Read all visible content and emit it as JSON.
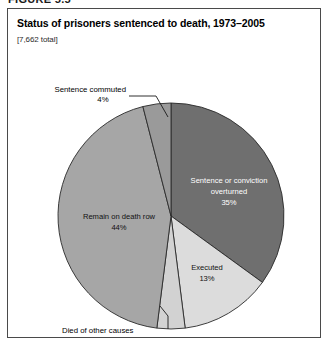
{
  "figure": {
    "number_label": "FIGURE 5.5"
  },
  "panel": {
    "title": "Status of prisoners sentenced to death, 1973–2005",
    "subtitle": "[7,662 total]"
  },
  "colors": {
    "overturned": "#6f6f6f",
    "executed": "#dcdcdc",
    "died_other": "#d2d2d2",
    "death_row": "#a6a6a6",
    "commuted": "#9a9a9a",
    "slice_outline": "#2a2a2a",
    "panel_border": "#4a4a4a",
    "background": "#ffffff"
  },
  "chart_data": {
    "type": "pie",
    "title": "Status of prisoners sentenced to death, 1973–2005",
    "subtitle": "[7,662 total]",
    "total": 7662,
    "total_label": "[7,662 total]",
    "legend": "none",
    "grid": false,
    "start_angle_deg": 0,
    "direction": "clockwise",
    "categories": [
      "Sentence or conviction overturned",
      "Executed",
      "Died of other causes",
      "Remain on death row",
      "Sentence commuted"
    ],
    "values": [
      35,
      13,
      4,
      44,
      4
    ],
    "slices": [
      {
        "label": "Sentence or conviction overturned",
        "label_line_1": "Sentence or conviction",
        "label_line_2": "overturned",
        "value": 35,
        "value_label": "35%",
        "color": "#6f6f6f",
        "label_placement": "inside",
        "text_color": "white"
      },
      {
        "label": "Executed",
        "label_line_1": "Executed",
        "label_line_2": "",
        "value": 13,
        "value_label": "13%",
        "color": "#dcdcdc",
        "label_placement": "inside",
        "text_color": "black"
      },
      {
        "label": "Died of other causes",
        "label_line_1": "Died of other causes",
        "label_line_2": "",
        "value": 4,
        "value_label": "",
        "color": "#d2d2d2",
        "label_placement": "outside-bottom",
        "text_color": "black"
      },
      {
        "label": "Remain on death row",
        "label_line_1": "Remain on death row",
        "label_line_2": "",
        "value": 44,
        "value_label": "44%",
        "color": "#a6a6a6",
        "label_placement": "inside",
        "text_color": "black"
      },
      {
        "label": "Sentence commuted",
        "label_line_1": "Sentence commuted",
        "label_line_2": "",
        "value": 4,
        "value_label": "4%",
        "color": "#9a9a9a",
        "label_placement": "outside-top-left",
        "text_color": "black"
      }
    ]
  },
  "labels": {
    "commuted_name": "Sentence commuted",
    "commuted_pct": "4%",
    "overturned_line1": "Sentence or conviction",
    "overturned_line2": "overturned",
    "overturned_pct": "35%",
    "death_row_name": "Remain on death row",
    "death_row_pct": "44%",
    "executed_name": "Executed",
    "executed_pct": "13%",
    "died_other_name": "Died of other causes"
  }
}
